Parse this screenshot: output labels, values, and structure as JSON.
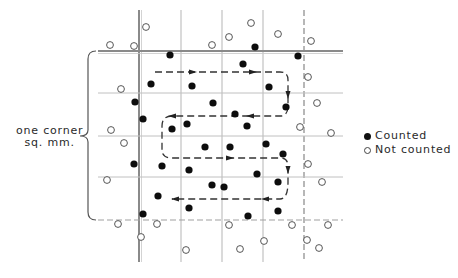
{
  "figure": {
    "side_label_line1": "one corner",
    "side_label_line2": "sq. mm.",
    "legend": [
      {
        "symbol": "filled-circle",
        "label": "Counted"
      },
      {
        "symbol": "hollow-circle",
        "label": "Not counted"
      }
    ]
  },
  "grid": {
    "vertical_lines_x": [
      139,
      181,
      222,
      263,
      304
    ],
    "horizontal_lines_y": [
      51,
      93,
      136,
      177,
      220
    ],
    "extent": {
      "x_min": 98,
      "x_max": 343,
      "y_min": 10,
      "y_max": 262
    },
    "thick_lines": {
      "left_x": 139,
      "top_y": 51
    },
    "dashed_lines": {
      "right_x": 304,
      "bottom_y": 220
    }
  },
  "dots": {
    "counted": [
      [
        170,
        55
      ],
      [
        255,
        47
      ],
      [
        298,
        56
      ],
      [
        243,
        64
      ],
      [
        151,
        84
      ],
      [
        192,
        86
      ],
      [
        269,
        87
      ],
      [
        135,
        102
      ],
      [
        213,
        103
      ],
      [
        286,
        107
      ],
      [
        143,
        119
      ],
      [
        235,
        114
      ],
      [
        172,
        129
      ],
      [
        187,
        124
      ],
      [
        247,
        126
      ],
      [
        205,
        147
      ],
      [
        230,
        147
      ],
      [
        266,
        144
      ],
      [
        283,
        154
      ],
      [
        134,
        164
      ],
      [
        162,
        166
      ],
      [
        189,
        170
      ],
      [
        257,
        174
      ],
      [
        278,
        182
      ],
      [
        212,
        185
      ],
      [
        224,
        187
      ],
      [
        158,
        196
      ],
      [
        189,
        208
      ],
      [
        248,
        216
      ],
      [
        278,
        211
      ],
      [
        143,
        214
      ]
    ],
    "not_counted": [
      [
        146,
        27
      ],
      [
        110,
        45
      ],
      [
        134,
        46
      ],
      [
        212,
        45
      ],
      [
        229,
        37
      ],
      [
        251,
        23
      ],
      [
        278,
        34
      ],
      [
        311,
        41
      ],
      [
        308,
        77
      ],
      [
        121,
        89
      ],
      [
        317,
        103
      ],
      [
        111,
        130
      ],
      [
        124,
        143
      ],
      [
        300,
        127
      ],
      [
        331,
        133
      ],
      [
        107,
        180
      ],
      [
        308,
        164
      ],
      [
        322,
        182
      ],
      [
        118,
        224
      ],
      [
        157,
        224
      ],
      [
        141,
        237
      ],
      [
        186,
        250
      ],
      [
        229,
        225
      ],
      [
        240,
        249
      ],
      [
        264,
        241
      ],
      [
        292,
        225
      ],
      [
        307,
        240
      ],
      [
        319,
        248
      ],
      [
        328,
        225
      ]
    ]
  },
  "path": {
    "description": "Dashed serpentine counting path with arrowheads",
    "segments": [
      "M 155 72 L 280 72 Q 288 72 288 80 L 288 106 Q 288 116 280 116 L 172 116 Q 162 116 162 126 L 162 150 Q 162 158 172 158 L 280 158 Q 288 158 288 166 L 288 182 Q 288 199 280 199 L 172 199"
    ],
    "arrows": [
      {
        "x": 193,
        "y": 72,
        "dir": "right"
      },
      {
        "x": 253,
        "y": 72,
        "dir": "right"
      },
      {
        "x": 288,
        "y": 95,
        "dir": "down"
      },
      {
        "x": 250,
        "y": 116,
        "dir": "left"
      },
      {
        "x": 172,
        "y": 116,
        "dir": "left"
      },
      {
        "x": 230,
        "y": 158,
        "dir": "right"
      },
      {
        "x": 288,
        "y": 170,
        "dir": "down"
      },
      {
        "x": 265,
        "y": 199,
        "dir": "left"
      },
      {
        "x": 175,
        "y": 199,
        "dir": "left"
      }
    ]
  },
  "brace": {
    "x": 88,
    "y_top": 51,
    "y_bottom": 220,
    "tip_x": 80,
    "tip_y": 136
  }
}
